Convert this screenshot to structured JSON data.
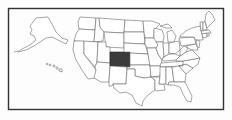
{
  "map": {
    "type": "locator-map",
    "region": "United States",
    "highlighted_state": "Colorado",
    "colors": {
      "highlight": "#3b3b3b",
      "state_fill": "#ffffff",
      "state_border": "#6a6a6a",
      "frame": "#333333",
      "background": "#fdfdfd"
    },
    "insets": [
      "Alaska",
      "Hawaii"
    ],
    "frame": {
      "x": 8,
      "y": 8,
      "width": 216,
      "height": 102
    }
  }
}
